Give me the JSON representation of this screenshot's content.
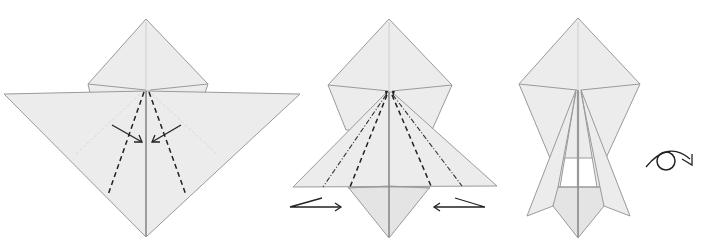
{
  "diagram": {
    "type": "origami-instruction-sequence",
    "steps": [
      {
        "index": 1,
        "description": "Valley-fold the edges to the centre line",
        "symbols": [
          "valley-fold-lines",
          "fold-direction-arrows"
        ]
      },
      {
        "index": 2,
        "description": "Squash / inside-reverse fold the sides inward",
        "symbols": [
          "valley-fold-lines",
          "mountain-fold-lines",
          "push-arrows"
        ]
      },
      {
        "index": 3,
        "description": "Turn the model over",
        "symbols": [
          "turn-over-symbol"
        ]
      }
    ],
    "colors": {
      "paper": "#ececec",
      "outline": "#9a9a9a",
      "fold_line": "#222222"
    }
  }
}
